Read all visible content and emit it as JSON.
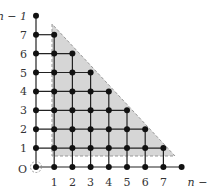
{
  "diagram": {
    "type": "lattice-grid-with-triangular-region",
    "grid": {
      "n_minus_1_index": 8,
      "origin_px": [
        36,
        167
      ],
      "dx": 18.2,
      "dy": 18.9
    },
    "x_labels": [
      "1",
      "2",
      "3",
      "4",
      "5",
      "6",
      "7",
      "n − 1"
    ],
    "y_labels": [
      "1",
      "2",
      "3",
      "4",
      "5",
      "6",
      "7",
      "n − 1"
    ],
    "origin_label": "O",
    "shaded_region": {
      "description": "right triangle, grey fill, dashed border",
      "vertices_px": [
        [
          52,
          24
        ],
        [
          52,
          156
        ],
        [
          175,
          156
        ]
      ],
      "fill": "#d6d6d6",
      "stroke": "#999999"
    },
    "colors": {
      "dot": "#111111",
      "line": "#222222",
      "label": "#333333"
    }
  }
}
